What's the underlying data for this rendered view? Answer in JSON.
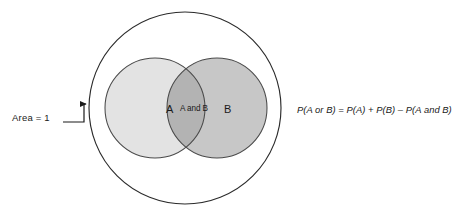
{
  "diagram": {
    "type": "venn-diagram",
    "sample_space": {
      "label": "Area = 1",
      "shape": "circle",
      "center": [
        185,
        108
      ],
      "radius": 96,
      "fill": "#ffffff",
      "stroke": "#2b2b2b"
    },
    "sets": [
      {
        "id": "A",
        "label": "A",
        "shape": "circle",
        "center": [
          155,
          108
        ],
        "radius": 50,
        "fill": "#e3e3e3",
        "stroke": "#4a4a4a"
      },
      {
        "id": "B",
        "label": "B",
        "shape": "circle",
        "center": [
          217,
          108
        ],
        "radius": 50,
        "fill": "#c7c7c7",
        "stroke": "#4a4a4a"
      }
    ],
    "intersection": {
      "label": "A and B",
      "fill": "#b3b3b3"
    },
    "callout": {
      "label": "Area = 1",
      "leader_color": "#1a1a1a",
      "arrow_target": [
        90,
        104
      ]
    },
    "formula": "P(A or B) = P(A) + P(B) – P(A and B)",
    "colors": {
      "background": "#ffffff",
      "text": "#1a1a1a",
      "outer_stroke": "#2b2b2b",
      "inner_stroke": "#4a4a4a",
      "set_a_fill": "#e3e3e3",
      "set_b_fill": "#c7c7c7",
      "intersection_fill": "#b3b3b3"
    }
  }
}
